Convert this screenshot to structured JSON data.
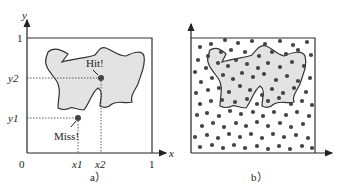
{
  "panel_a": {
    "caption": "a）",
    "axis_x_label": "x",
    "axis_y_label": "y",
    "origin_label": "0",
    "x_ticks": [
      "x1",
      "x2",
      "1"
    ],
    "y_ticks": [
      "y1",
      "y2",
      "1"
    ],
    "hit_label": "Hit!",
    "miss_label": "Miss!",
    "points": [
      {
        "name": "hit",
        "x_label": "x2",
        "y_label": "y2"
      },
      {
        "name": "miss",
        "x_label": "x1",
        "y_label": "y1"
      }
    ]
  },
  "panel_b": {
    "caption": "b）",
    "description": "Random points scattered uniformly in unit square; shaded irregular region"
  },
  "colors": {
    "region_fill": "#e3e3e3",
    "stroke": "#333333",
    "dot": "#444444"
  }
}
